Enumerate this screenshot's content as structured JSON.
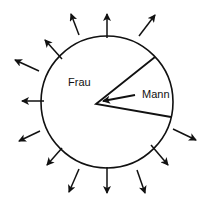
{
  "diagram": {
    "labels": {
      "outer": "Frau",
      "inner": "Mann"
    },
    "colors": {
      "stroke": "#111111",
      "background": "#ffffff"
    },
    "circle": {
      "cx": 107,
      "cy": 102,
      "r": 66
    },
    "sector": {
      "vertex": [
        96,
        104
      ],
      "edge_a": [
        155,
        57
      ],
      "edge_b": [
        171,
        117
      ]
    },
    "inner_arrow": {
      "from": [
        135,
        95
      ],
      "to": [
        103,
        101
      ]
    },
    "outward_arrows": [
      {
        "from": [
          107,
          38
        ],
        "to": [
          107,
          14
        ]
      },
      {
        "from": [
          139,
          36
        ],
        "to": [
          155,
          15
        ]
      },
      {
        "from": [
          79,
          35
        ],
        "to": [
          71,
          14
        ]
      },
      {
        "from": [
          62,
          59
        ],
        "to": [
          45,
          40
        ]
      },
      {
        "from": [
          39,
          71
        ],
        "to": [
          15,
          60
        ]
      },
      {
        "from": [
          44,
          101
        ],
        "to": [
          22,
          101
        ]
      },
      {
        "from": [
          40,
          131
        ],
        "to": [
          19,
          141
        ]
      },
      {
        "from": [
          62,
          148
        ],
        "to": [
          47,
          165
        ]
      },
      {
        "from": [
          79,
          169
        ],
        "to": [
          69,
          192
        ]
      },
      {
        "from": [
          107,
          167
        ],
        "to": [
          107,
          193
        ]
      },
      {
        "from": [
          137,
          170
        ],
        "to": [
          145,
          193
        ]
      },
      {
        "from": [
          151,
          145
        ],
        "to": [
          168,
          165
        ]
      },
      {
        "from": [
          173,
          129
        ],
        "to": [
          196,
          140
        ]
      }
    ]
  }
}
